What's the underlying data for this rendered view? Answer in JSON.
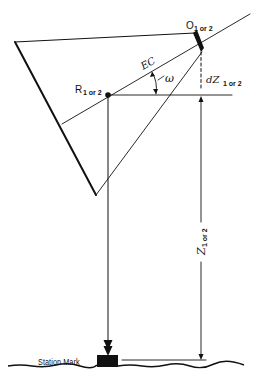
{
  "figure": {
    "type": "geometric surveying diagram",
    "colors": {
      "line": "#111111",
      "background": "#ffffff"
    }
  },
  "labels": {
    "O": {
      "main": "O",
      "sub": "1 or 2"
    },
    "R": {
      "main": "R",
      "sub": "1 or 2"
    },
    "EC": {
      "main": "EC"
    },
    "omega": {
      "main": "ω"
    },
    "dZ": {
      "main": "dZ",
      "sub": "1 or 2"
    },
    "Z": {
      "main": "Z",
      "sub": "1 or 2"
    },
    "station_mark": "Station Mark"
  }
}
